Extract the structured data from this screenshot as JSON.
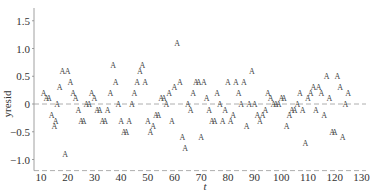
{
  "chart_data": {
    "type": "scatter",
    "title": "",
    "xlabel": "t",
    "ylabel": "yresid",
    "marker": "A",
    "xlim": [
      10,
      130
    ],
    "ylim": [
      -1.2,
      1.75
    ],
    "x_ticks": [
      10,
      20,
      30,
      40,
      50,
      60,
      70,
      80,
      90,
      100,
      110,
      120,
      130
    ],
    "y_ticks": [
      -1.0,
      -0.5,
      0,
      0.5,
      1.0,
      1.5
    ],
    "y_tick_labels": [
      "−1.0",
      "−0.5",
      "0",
      "0.5",
      "1.0",
      "1.5"
    ],
    "reference_lines": [
      {
        "y": 0,
        "style": "dashed"
      },
      {
        "y": -1.2,
        "style": "dashed"
      }
    ],
    "grid": false,
    "legend": null,
    "series": [
      {
        "name": "yresid",
        "points": [
          [
            11,
            0.2
          ],
          [
            12,
            0.1
          ],
          [
            13,
            0.1
          ],
          [
            14,
            -0.2
          ],
          [
            15,
            -0.4
          ],
          [
            15.5,
            -0.3
          ],
          [
            16,
            0.0
          ],
          [
            17,
            0.3
          ],
          [
            18,
            0.6
          ],
          [
            19,
            -0.9
          ],
          [
            20,
            0.6
          ],
          [
            21,
            0.4
          ],
          [
            22,
            0.2
          ],
          [
            23,
            0.1
          ],
          [
            24,
            -0.1
          ],
          [
            25,
            -0.3
          ],
          [
            26,
            -0.3
          ],
          [
            27,
            0.0
          ],
          [
            28,
            0.0
          ],
          [
            29,
            0.2
          ],
          [
            30,
            0.1
          ],
          [
            31,
            -0.1
          ],
          [
            32,
            -0.1
          ],
          [
            33,
            -0.3
          ],
          [
            34,
            -0.3
          ],
          [
            35,
            -0.1
          ],
          [
            36,
            0.2
          ],
          [
            37,
            0.7
          ],
          [
            38,
            0.4
          ],
          [
            39,
            0.0
          ],
          [
            40,
            -0.3
          ],
          [
            41,
            -0.5
          ],
          [
            42,
            -0.5
          ],
          [
            43,
            -0.3
          ],
          [
            44,
            0.0
          ],
          [
            45,
            0.2
          ],
          [
            46,
            0.4
          ],
          [
            47,
            0.6
          ],
          [
            48,
            0.7
          ],
          [
            49,
            0.4
          ],
          [
            50,
            -0.3
          ],
          [
            51,
            -0.5
          ],
          [
            52,
            -0.4
          ],
          [
            53,
            -0.2
          ],
          [
            54,
            -0.2
          ],
          [
            55,
            0.1
          ],
          [
            56,
            0.1
          ],
          [
            57,
            0.0
          ],
          [
            58,
            0.2
          ],
          [
            59,
            -0.3
          ],
          [
            60,
            0.3
          ],
          [
            61,
            1.1
          ],
          [
            62,
            0.4
          ],
          [
            63,
            -0.6
          ],
          [
            64,
            -0.8
          ],
          [
            65,
            0.0
          ],
          [
            66,
            -0.1
          ],
          [
            67,
            0.2
          ],
          [
            68,
            0.4
          ],
          [
            69,
            0.4
          ],
          [
            70,
            -0.6
          ],
          [
            71,
            0.4
          ],
          [
            72,
            0.1
          ],
          [
            73,
            -0.1
          ],
          [
            74,
            -0.3
          ],
          [
            75,
            -0.3
          ],
          [
            76,
            0.2
          ],
          [
            77,
            0.0
          ],
          [
            78,
            -0.3
          ],
          [
            79,
            -0.1
          ],
          [
            80,
            0.4
          ],
          [
            81,
            -0.3
          ],
          [
            82,
            -0.2
          ],
          [
            83,
            0.4
          ],
          [
            84,
            0.2
          ],
          [
            85,
            0.0
          ],
          [
            86,
            0.4
          ],
          [
            87,
            -0.4
          ],
          [
            88,
            0.0
          ],
          [
            89,
            0.6
          ],
          [
            90,
            0.0
          ],
          [
            91,
            -0.2
          ],
          [
            92,
            -0.3
          ],
          [
            93,
            -0.2
          ],
          [
            94,
            -0.1
          ],
          [
            95,
            0.2
          ],
          [
            96,
            0.1
          ],
          [
            97,
            0.0
          ],
          [
            98,
            0.0
          ],
          [
            99,
            0.0
          ],
          [
            100,
            0.1
          ],
          [
            101,
            0.1
          ],
          [
            102,
            -0.4
          ],
          [
            103,
            -0.2
          ],
          [
            104,
            -0.1
          ],
          [
            105,
            -0.1
          ],
          [
            106,
            0.0
          ],
          [
            107,
            0.2
          ],
          [
            108,
            -0.1
          ],
          [
            109,
            -0.7
          ],
          [
            110,
            0.1
          ],
          [
            111,
            0.2
          ],
          [
            112,
            0.3
          ],
          [
            113,
            -0.1
          ],
          [
            114,
            0.3
          ],
          [
            115,
            0.2
          ],
          [
            116,
            -0.2
          ],
          [
            117,
            0.5
          ],
          [
            118,
            0.1
          ],
          [
            119,
            -0.5
          ],
          [
            120,
            -0.5
          ],
          [
            121,
            0.5
          ],
          [
            122,
            0.3
          ],
          [
            123,
            -0.6
          ],
          [
            124,
            0.0
          ],
          [
            125,
            0.2
          ]
        ]
      }
    ]
  },
  "layout": {
    "plot_left": 41,
    "px_per_x": 2.67,
    "y_zero_px": 104,
    "px_per_y": 55.5,
    "axis_color": "#888888",
    "ref_line_color": "#999999",
    "marker_color": "#444444"
  }
}
